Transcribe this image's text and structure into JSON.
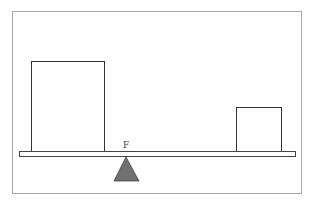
{
  "diagram": {
    "type": "lever-balance",
    "fulcrum_label": "F",
    "objects": [
      {
        "name": "large-block",
        "side": "left"
      },
      {
        "name": "small-block",
        "side": "right"
      }
    ],
    "colors": {
      "fulcrum": "#707070",
      "outline": "#333333",
      "frame": "#a8a8a8"
    }
  },
  "caption": ""
}
